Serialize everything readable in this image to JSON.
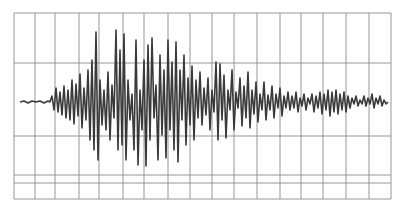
{
  "chart_data": {
    "type": "line",
    "title": "",
    "subtitle": "",
    "xlabel": "",
    "ylabel": "",
    "legend": [],
    "grid": true,
    "colors": {
      "trace": "#3a3a3a",
      "grid": "#8a8a8a",
      "background": "#ffffff"
    },
    "frame": {
      "left": 14,
      "top": 13,
      "right": 391,
      "bottom": 199
    },
    "grid_x": [
      14,
      35,
      55,
      79,
      99,
      123,
      144,
      168,
      190,
      212,
      234,
      257,
      280,
      301,
      323,
      346,
      369,
      391
    ],
    "grid_y": [
      13,
      63,
      136,
      175,
      183,
      199
    ],
    "baseline_y": 102,
    "trace": [
      [
        20,
        102
      ],
      [
        24,
        101
      ],
      [
        28,
        103
      ],
      [
        32,
        101
      ],
      [
        36,
        102
      ],
      [
        40,
        101
      ],
      [
        44,
        103
      ],
      [
        48,
        101
      ],
      [
        50,
        102
      ],
      [
        52,
        96
      ],
      [
        54,
        110
      ],
      [
        56,
        88
      ],
      [
        58,
        112
      ],
      [
        60,
        92
      ],
      [
        62,
        115
      ],
      [
        64,
        86
      ],
      [
        66,
        118
      ],
      [
        68,
        90
      ],
      [
        70,
        120
      ],
      [
        72,
        80
      ],
      [
        74,
        124
      ],
      [
        76,
        84
      ],
      [
        78,
        116
      ],
      [
        80,
        74
      ],
      [
        82,
        128
      ],
      [
        84,
        88
      ],
      [
        86,
        120
      ],
      [
        88,
        70
      ],
      [
        90,
        140
      ],
      [
        92,
        60
      ],
      [
        94,
        150
      ],
      [
        96,
        32
      ],
      [
        98,
        160
      ],
      [
        100,
        80
      ],
      [
        102,
        125
      ],
      [
        104,
        90
      ],
      [
        106,
        130
      ],
      [
        108,
        72
      ],
      [
        110,
        140
      ],
      [
        112,
        85
      ],
      [
        114,
        118
      ],
      [
        116,
        30
      ],
      [
        118,
        150
      ],
      [
        120,
        50
      ],
      [
        122,
        145
      ],
      [
        124,
        34
      ],
      [
        126,
        160
      ],
      [
        128,
        80
      ],
      [
        130,
        120
      ],
      [
        132,
        94
      ],
      [
        134,
        150
      ],
      [
        136,
        40
      ],
      [
        138,
        165
      ],
      [
        140,
        90
      ],
      [
        142,
        130
      ],
      [
        144,
        60
      ],
      [
        146,
        166
      ],
      [
        148,
        45
      ],
      [
        150,
        140
      ],
      [
        152,
        38
      ],
      [
        154,
        118
      ],
      [
        156,
        85
      ],
      [
        158,
        160
      ],
      [
        160,
        55
      ],
      [
        162,
        135
      ],
      [
        164,
        70
      ],
      [
        166,
        158
      ],
      [
        168,
        40
      ],
      [
        170,
        130
      ],
      [
        172,
        62
      ],
      [
        174,
        150
      ],
      [
        176,
        42
      ],
      [
        178,
        162
      ],
      [
        180,
        70
      ],
      [
        182,
        120
      ],
      [
        184,
        55
      ],
      [
        186,
        145
      ],
      [
        188,
        78
      ],
      [
        190,
        125
      ],
      [
        192,
        66
      ],
      [
        194,
        140
      ],
      [
        196,
        80
      ],
      [
        198,
        118
      ],
      [
        200,
        72
      ],
      [
        202,
        125
      ],
      [
        204,
        88
      ],
      [
        206,
        115
      ],
      [
        208,
        78
      ],
      [
        210,
        130
      ],
      [
        212,
        90
      ],
      [
        214,
        112
      ],
      [
        216,
        62
      ],
      [
        218,
        140
      ],
      [
        220,
        64
      ],
      [
        222,
        120
      ],
      [
        224,
        75
      ],
      [
        226,
        138
      ],
      [
        228,
        90
      ],
      [
        230,
        110
      ],
      [
        232,
        70
      ],
      [
        234,
        130
      ],
      [
        236,
        92
      ],
      [
        238,
        108
      ],
      [
        240,
        78
      ],
      [
        242,
        126
      ],
      [
        244,
        86
      ],
      [
        246,
        118
      ],
      [
        248,
        72
      ],
      [
        250,
        128
      ],
      [
        252,
        90
      ],
      [
        254,
        114
      ],
      [
        256,
        82
      ],
      [
        258,
        122
      ],
      [
        260,
        94
      ],
      [
        262,
        110
      ],
      [
        264,
        82
      ],
      [
        266,
        120
      ],
      [
        268,
        95
      ],
      [
        270,
        110
      ],
      [
        272,
        86
      ],
      [
        274,
        118
      ],
      [
        276,
        94
      ],
      [
        278,
        108
      ],
      [
        280,
        88
      ],
      [
        282,
        116
      ],
      [
        284,
        96
      ],
      [
        286,
        108
      ],
      [
        288,
        92
      ],
      [
        290,
        110
      ],
      [
        292,
        96
      ],
      [
        294,
        108
      ],
      [
        296,
        92
      ],
      [
        298,
        112
      ],
      [
        300,
        98
      ],
      [
        302,
        106
      ],
      [
        304,
        94
      ],
      [
        306,
        110
      ],
      [
        308,
        98
      ],
      [
        310,
        104
      ],
      [
        312,
        94
      ],
      [
        314,
        112
      ],
      [
        316,
        96
      ],
      [
        318,
        108
      ],
      [
        320,
        92
      ],
      [
        322,
        114
      ],
      [
        324,
        94
      ],
      [
        326,
        110
      ],
      [
        328,
        90
      ],
      [
        330,
        116
      ],
      [
        332,
        92
      ],
      [
        334,
        112
      ],
      [
        336,
        90
      ],
      [
        338,
        114
      ],
      [
        340,
        94
      ],
      [
        342,
        110
      ],
      [
        344,
        92
      ],
      [
        346,
        112
      ],
      [
        348,
        96
      ],
      [
        350,
        108
      ],
      [
        352,
        98
      ],
      [
        354,
        104
      ],
      [
        356,
        96
      ],
      [
        358,
        106
      ],
      [
        360,
        100
      ],
      [
        362,
        104
      ],
      [
        364,
        96
      ],
      [
        366,
        106
      ],
      [
        368,
        98
      ],
      [
        370,
        104
      ],
      [
        372,
        94
      ],
      [
        374,
        108
      ],
      [
        376,
        98
      ],
      [
        378,
        104
      ],
      [
        380,
        96
      ],
      [
        382,
        106
      ],
      [
        384,
        100
      ],
      [
        386,
        104
      ],
      [
        388,
        102
      ]
    ]
  }
}
